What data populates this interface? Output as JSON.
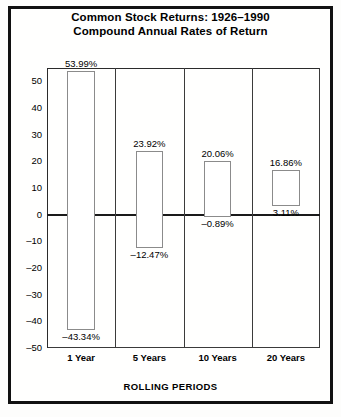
{
  "chart_data": {
    "type": "bar",
    "title": "Common Stock Returns: 1926–1990",
    "subtitle": "Compound Annual Rates of Return",
    "xlabel": "ROLLING PERIODS",
    "ylabel": "",
    "ylim": [
      -50,
      55
    ],
    "yticks": [
      50,
      40,
      30,
      20,
      10,
      0,
      -10,
      -20,
      -30,
      -40,
      -50
    ],
    "ytick_labels": [
      "50",
      "40",
      "30",
      "20",
      "10",
      "0",
      "–10",
      "–20",
      "–30",
      "–40",
      "–50"
    ],
    "grid": false,
    "legend": "none",
    "categories": [
      "1 Year",
      "5 Years",
      "10 Years",
      "20 Years"
    ],
    "series": [
      {
        "name": "High (Best) Compound Annual Return",
        "values": [
          53.99,
          23.92,
          20.06,
          16.86
        ],
        "labels": [
          "53.99%",
          "23.92%",
          "20.06%",
          "16.86%"
        ]
      },
      {
        "name": "Low (Worst) Compound Annual Return",
        "values": [
          -43.34,
          -12.47,
          -0.89,
          3.11
        ],
        "labels": [
          "–43.34%",
          "–12.47%",
          "–0.89%",
          "3.11%"
        ]
      }
    ],
    "bars": [
      {
        "category": "1 Year",
        "high": 53.99,
        "low": -43.34,
        "high_label": "53.99%",
        "low_label": "–43.34%"
      },
      {
        "category": "5 Years",
        "high": 23.92,
        "low": -12.47,
        "high_label": "23.92%",
        "low_label": "–12.47%"
      },
      {
        "category": "10 Years",
        "high": 20.06,
        "low": -0.89,
        "high_label": "20.06%",
        "low_label": "–0.89%"
      },
      {
        "category": "20 Years",
        "high": 16.86,
        "low": 3.11,
        "high_label": "16.86%",
        "low_label": "3.11%"
      }
    ],
    "colors": {
      "bar_fill": "#ffffff",
      "bar_stroke": "#8b8b8b",
      "axis": "#1a1a1a",
      "text": "#000000",
      "background": "#ffffff"
    }
  }
}
